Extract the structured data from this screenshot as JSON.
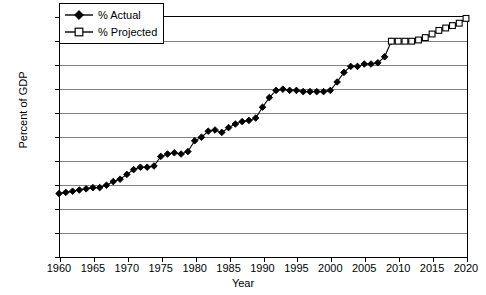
{
  "chart_data": {
    "type": "line",
    "title": "",
    "xlabel": "Year",
    "ylabel": "Percent of GDP",
    "xlim": [
      1960,
      2020
    ],
    "ylim": [
      0.0,
      20.0
    ],
    "grid": true,
    "legend_position": "top-left",
    "x_ticks": [
      "1960",
      "1965",
      "1970",
      "1975",
      "1980",
      "1985",
      "1990",
      "1995",
      "2000",
      "2005",
      "2010",
      "2015",
      "2020"
    ],
    "y_ticks": [
      "0.0",
      "2.0",
      "4.0",
      "6.0",
      "8.0",
      "10.0",
      "12.0",
      "14.0",
      "16.0",
      "18.0",
      "20.0"
    ],
    "series": [
      {
        "name": "% Actual",
        "marker": "filled-diamond",
        "x": [
          1960,
          1961,
          1962,
          1963,
          1964,
          1965,
          1966,
          1967,
          1968,
          1969,
          1970,
          1971,
          1972,
          1973,
          1974,
          1975,
          1976,
          1977,
          1978,
          1979,
          1980,
          1981,
          1982,
          1983,
          1984,
          1985,
          1986,
          1987,
          1988,
          1989,
          1990,
          1991,
          1992,
          1993,
          1994,
          1995,
          1996,
          1997,
          1998,
          1999,
          2000,
          2001,
          2002,
          2003,
          2004,
          2005,
          2006,
          2007,
          2008,
          2009
        ],
        "values": [
          5.2,
          5.3,
          5.4,
          5.5,
          5.6,
          5.7,
          5.7,
          5.9,
          6.2,
          6.4,
          6.8,
          7.2,
          7.4,
          7.4,
          7.5,
          8.3,
          8.5,
          8.6,
          8.5,
          8.7,
          9.6,
          9.9,
          10.4,
          10.5,
          10.3,
          10.7,
          11.0,
          11.2,
          11.3,
          11.5,
          12.4,
          13.2,
          13.8,
          13.9,
          13.8,
          13.8,
          13.7,
          13.7,
          13.7,
          13.7,
          13.8,
          14.5,
          15.3,
          15.8,
          15.8,
          16.0,
          16.0,
          16.1,
          16.6,
          17.9
        ]
      },
      {
        "name": "% Projected",
        "marker": "open-square",
        "x": [
          2009,
          2010,
          2011,
          2012,
          2013,
          2014,
          2015,
          2016,
          2017,
          2018,
          2019,
          2020
        ],
        "values": [
          17.9,
          17.9,
          17.9,
          17.9,
          18.0,
          18.2,
          18.5,
          18.8,
          19.0,
          19.2,
          19.4,
          19.8
        ]
      }
    ]
  },
  "legend": {
    "items": [
      {
        "label": "% Actual"
      },
      {
        "label": "% Projected"
      }
    ]
  },
  "colors": {
    "series_actual": "#000000",
    "series_projected": "#000000",
    "gridline": "#808080",
    "axis": "#000000",
    "background": "#ffffff"
  }
}
